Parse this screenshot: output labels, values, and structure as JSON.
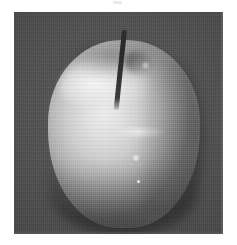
{
  "page": {
    "background_color": "#ffffff",
    "width": 237,
    "height": 245
  },
  "artifact": {
    "name": "scan-speck",
    "description": "faint light scan artifact near top center"
  },
  "photo": {
    "subject": "apple",
    "caption": "",
    "alt_text": "Grayscale photograph of a single apple with stem, lit from upper left, against a dark background",
    "frame": {
      "left": 14,
      "top": 12,
      "width": 209,
      "height": 222
    },
    "colors": {
      "background_dark": "#4a4a4a",
      "background_darkest": "#3a3a3a",
      "apple_highlight": "#ededed",
      "apple_midtone": "#b6b6b6",
      "apple_shadow": "#7d7d7d",
      "stem_dark": "#2e2e2e",
      "page_white": "#ffffff"
    },
    "elements": {
      "apple_body": "apple-body",
      "stem": "apple-stem",
      "shoulder_highlight": "shoulder-highlight",
      "specular_highlight": "specular-highlight",
      "crown_shadow": "crown-shadow",
      "base_shadow": "base-shadow"
    },
    "texture": {
      "type": "halftone-dither",
      "description": "printed halftone / dithered grain over entire plate"
    }
  }
}
